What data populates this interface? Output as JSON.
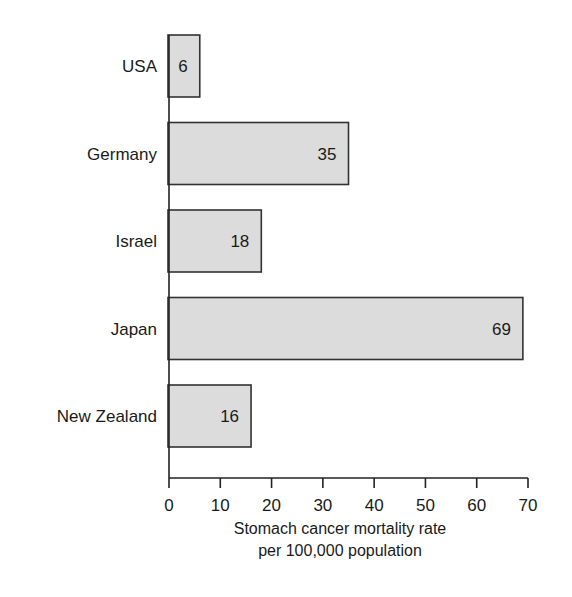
{
  "chart_data": {
    "type": "bar",
    "orientation": "horizontal",
    "title": "",
    "categories": [
      "USA",
      "Germany",
      "Israel",
      "Japan",
      "New Zealand"
    ],
    "values": [
      6,
      35,
      18,
      69,
      16
    ],
    "data_labels": [
      "6",
      "35",
      "18",
      "69",
      "16"
    ],
    "xlabel": "Stomach cancer mortality rate per 100,000 population",
    "xlabel_lines": [
      "Stomach cancer mortality rate",
      "per 100,000 population"
    ],
    "ylabel": "",
    "xlim": [
      0,
      70
    ],
    "xticks": [
      0,
      10,
      20,
      30,
      40,
      50,
      60,
      70
    ],
    "grid": false,
    "legend": null,
    "colors": {
      "bar_fill": "#dcdcdc",
      "bar_stroke": "#333333",
      "axis": "#222222",
      "text": "#1a1a1a"
    }
  }
}
